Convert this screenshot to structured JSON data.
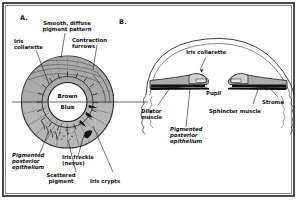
{
  "figure": {
    "background_color": "#ffffff",
    "frame_color": "#4a4a4a",
    "inner_frame_color": "#8c8c8c",
    "iris_fill_color": "#b8b8b8",
    "pigment_color": "#1a1a1a"
  },
  "panels": [
    {
      "letter": "A.",
      "name": "anterior-iris-surface-view",
      "center_labels": [
        {
          "name": "brown-iris-half-label",
          "text": "Brown"
        },
        {
          "name": "blue-iris-half-label",
          "text": "Blue"
        }
      ],
      "labels": [
        {
          "name": "smooth-diffuse-pigment-pattern-label",
          "text": "Smooth, diffuse\npigment pattern"
        },
        {
          "name": "contraction-furrows-label",
          "text": "Contraction\nfurrows"
        },
        {
          "name": "iris-collarette-label",
          "text": "Iris\ncollarette"
        },
        {
          "name": "pigmented-posterior-epithelium-label",
          "text": "Pigmented\nposterior\nepithelium"
        },
        {
          "name": "iris-freckle-nevus-label",
          "text": "Iris freckle\n(nevus)"
        },
        {
          "name": "scattered-pigment-label",
          "text": "Scattered\npigment"
        },
        {
          "name": "iris-crypts-label",
          "text": "Iris crypts"
        }
      ]
    },
    {
      "letter": "B.",
      "name": "iris-cross-section-view",
      "labels": [
        {
          "name": "iris-collarette-label",
          "text": "Iris collarette"
        },
        {
          "name": "pupil-label",
          "text": "Pupil"
        },
        {
          "name": "stroma-label",
          "text": "Stroma"
        },
        {
          "name": "dilator-muscle-label",
          "text": "Dilator\nmuscle"
        },
        {
          "name": "sphincter-muscle-label",
          "text": "Sphincter muscle"
        },
        {
          "name": "pigmented-posterior-epithelium-label",
          "text": "Pigmented\nposterior\nepithelium"
        }
      ]
    }
  ]
}
